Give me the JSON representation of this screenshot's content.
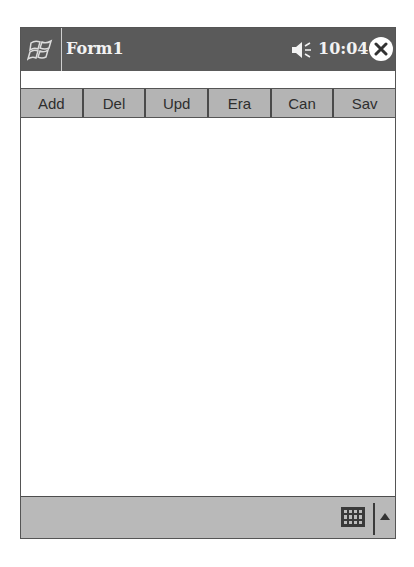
{
  "titlebar": {
    "title": "Form1",
    "time": "10:04",
    "icons": {
      "start": "windows-flag-icon",
      "volume": "speaker-icon",
      "close": "close-circle-icon"
    }
  },
  "toolbar": {
    "buttons": [
      {
        "label": "Add"
      },
      {
        "label": "Del"
      },
      {
        "label": "Upd"
      },
      {
        "label": "Era"
      },
      {
        "label": "Can"
      },
      {
        "label": "Sav"
      }
    ]
  },
  "bottombar": {
    "icons": {
      "keyboard": "keyboard-icon",
      "sip_menu": "up-arrow-icon"
    }
  },
  "colors": {
    "titlebar_bg": "#5a5a5a",
    "toolbar_button_bg": "#b4b4b4",
    "bottombar_bg": "#b9b9b9"
  }
}
